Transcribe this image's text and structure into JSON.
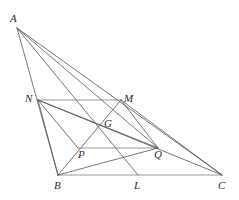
{
  "figure": {
    "width": 239,
    "height": 200,
    "background_color": "#ffffff",
    "stroke_color_diagonal": "#545454",
    "stroke_color_horizontal": "#9a9a9a",
    "label_color": "#2b2b2b",
    "stroke_width": 0.8
  },
  "points": {
    "A": {
      "label": "A",
      "x": 17,
      "y": 28,
      "label_x": 10,
      "label_y": 13
    },
    "B": {
      "label": "B",
      "x": 58,
      "y": 175,
      "label_x": 54,
      "label_y": 180
    },
    "C": {
      "label": "C",
      "x": 222,
      "y": 175,
      "label_x": 218,
      "label_y": 180
    },
    "N": {
      "label": "N",
      "x": 38,
      "y": 100,
      "label_x": 25,
      "label_y": 93
    },
    "M": {
      "label": "M",
      "x": 121,
      "y": 100,
      "label_x": 124,
      "label_y": 93
    },
    "G": {
      "label": "G",
      "x": 100,
      "y": 124,
      "label_x": 104,
      "label_y": 118
    },
    "P": {
      "label": "P",
      "x": 78,
      "y": 148,
      "label_x": 78,
      "label_y": 149
    },
    "Q": {
      "label": "Q",
      "x": 158,
      "y": 148,
      "label_x": 154,
      "label_y": 149
    },
    "L": {
      "label": "L",
      "x": 138,
      "y": 175,
      "label_x": 134,
      "label_y": 180
    }
  },
  "segments": [
    {
      "name": "segment-BC",
      "from": "B",
      "to": "C",
      "kind": "horizontal"
    },
    {
      "name": "segment-NM",
      "from": "N",
      "to": "M",
      "kind": "horizontal"
    },
    {
      "name": "segment-PQ",
      "from": "P",
      "to": "Q",
      "kind": "horizontal"
    },
    {
      "name": "segment-AB",
      "from": "A",
      "to": "B",
      "kind": "diagonal"
    },
    {
      "name": "segment-AC",
      "from": "A",
      "to": "C",
      "kind": "diagonal"
    },
    {
      "name": "segment-AL",
      "from": "A",
      "to": "L",
      "kind": "diagonal"
    },
    {
      "name": "segment-AQ",
      "from": "A",
      "to": "Q",
      "kind": "diagonal"
    },
    {
      "name": "segment-NB",
      "from": "N",
      "to": "B",
      "kind": "diagonal"
    },
    {
      "name": "segment-NC",
      "from": "N",
      "to": "C",
      "kind": "diagonal"
    },
    {
      "name": "segment-NQ",
      "from": "N",
      "to": "Q",
      "kind": "diagonal"
    },
    {
      "name": "segment-NP",
      "from": "N",
      "to": "P",
      "kind": "diagonal"
    },
    {
      "name": "segment-MB",
      "from": "M",
      "to": "B",
      "kind": "diagonal"
    },
    {
      "name": "segment-MC",
      "from": "M",
      "to": "C",
      "kind": "diagonal"
    },
    {
      "name": "segment-MQ",
      "from": "M",
      "to": "Q",
      "kind": "diagonal"
    },
    {
      "name": "segment-BQ",
      "from": "B",
      "to": "Q",
      "kind": "diagonal"
    }
  ]
}
